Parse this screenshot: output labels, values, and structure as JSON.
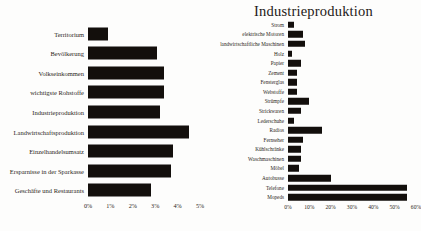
{
  "chart_data": [
    {
      "id": "left",
      "type": "bar",
      "orientation": "horizontal",
      "title": "",
      "xlabel": "",
      "ylabel": "",
      "xlim": [
        0,
        5
      ],
      "unit": "%",
      "grid": false,
      "legend": "none",
      "bar_color": "#130f0c",
      "ticks": [
        "0%",
        "1%",
        "2%",
        "3%",
        "4%",
        "5%"
      ],
      "tick_values": [
        0,
        1,
        2,
        3,
        4,
        5
      ],
      "categories": [
        "Territorium",
        "Bevölkerung",
        "Volkseinkommen",
        "wichtigste Rohstoffe",
        "Industrieproduktion",
        "Landwirtschaftsproduktion",
        "Einzelhandelsumsatz",
        "Ersparnisse in der Sparkasse",
        "Geschäfte und Restaurants"
      ],
      "values": [
        0.9,
        3.1,
        3.4,
        3.4,
        3.2,
        4.5,
        3.8,
        3.7,
        2.8
      ]
    },
    {
      "id": "right",
      "type": "bar",
      "orientation": "horizontal",
      "title": "Industrieproduktion",
      "xlabel": "",
      "ylabel": "",
      "xlim": [
        0,
        60
      ],
      "unit": "%",
      "grid": false,
      "legend": "none",
      "bar_color": "#130f0c",
      "ticks": [
        "0%",
        "10%",
        "20%",
        "30%",
        "40%",
        "50%",
        "60%"
      ],
      "tick_values": [
        0,
        10,
        20,
        30,
        40,
        50,
        60
      ],
      "categories": [
        "Strom",
        "elektrische Motoren",
        "landwirtschaftliche Maschinen",
        "Holz",
        "Papier",
        "Zement",
        "Fensterglas",
        "Webstoffe",
        "Strümpfe",
        "Strickwaren",
        "Lederschuhe",
        "Radios",
        "Fernseher",
        "Kühlschränke",
        "Waschmaschinen",
        "Möbel",
        "Autobusse",
        "Telefone",
        "Mopeds"
      ],
      "values": [
        3,
        7,
        8,
        2,
        6,
        4,
        4,
        4,
        10,
        6,
        3,
        16,
        7,
        6,
        6,
        5,
        20,
        56,
        56
      ]
    }
  ]
}
